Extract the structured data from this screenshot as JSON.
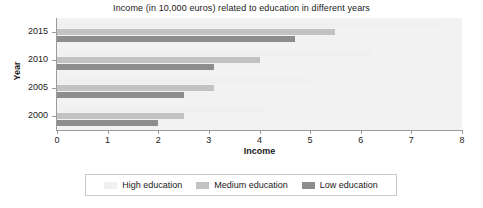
{
  "chart_data": {
    "type": "bar",
    "orientation": "horizontal",
    "title": "Income (in 10,000 euros) related to education in different years",
    "xlabel": "Income",
    "ylabel": "Year",
    "categories": [
      "2015",
      "2010",
      "2005",
      "2000"
    ],
    "xlim": [
      0,
      8
    ],
    "xticks": [
      0,
      1,
      2,
      3,
      4,
      5,
      6,
      7,
      8
    ],
    "xticklabels": [
      "0",
      "1",
      "2",
      "3",
      "4",
      "5",
      "6",
      "7",
      "8"
    ],
    "grid": false,
    "legend_position": "bottom",
    "series": [
      {
        "name": "High education",
        "color": "#f0f0f0",
        "values": [
          7.6,
          6.2,
          5.0,
          4.1
        ]
      },
      {
        "name": "Medium education",
        "color": "#c2c2c2",
        "values": [
          5.5,
          4.0,
          3.1,
          2.5
        ]
      },
      {
        "name": "Low education",
        "color": "#8d8d8d",
        "values": [
          4.7,
          3.1,
          2.5,
          2.0
        ]
      }
    ]
  },
  "legend": {
    "items": [
      {
        "label": "High education",
        "swatch": "high"
      },
      {
        "label": "Medium education",
        "swatch": "medium"
      },
      {
        "label": "Low education",
        "swatch": "low"
      }
    ]
  }
}
